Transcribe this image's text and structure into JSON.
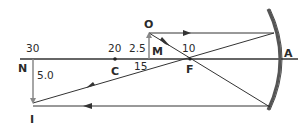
{
  "figure": {
    "type": "concave-mirror-ray-diagram",
    "colors": {
      "line": "#333333",
      "mirror": "#555555",
      "object_arrow": "#888888",
      "background": "#ffffff"
    },
    "labels": {
      "object": "O",
      "image": "I",
      "center_of_curvature": "C",
      "focal_point": "F",
      "mirror_vertex": "A",
      "object_base": "M",
      "image_base": "N"
    },
    "distances": {
      "image_distance": "30",
      "center_distance": "20",
      "object_distance": "15",
      "focal_distance": "10"
    },
    "heights": {
      "object_height": "2.5",
      "image_height": "5.0"
    }
  }
}
